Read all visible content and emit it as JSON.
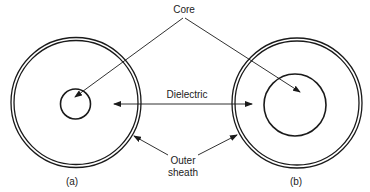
{
  "diagram": {
    "labels": {
      "core": "Core",
      "dielectric": "Dielectric",
      "outer_sheath_line1": "Outer",
      "outer_sheath_line2": "sheath",
      "caption_a": "(a)",
      "caption_b": "(b)"
    },
    "panels": [
      {
        "id": "a",
        "caption": "(a)",
        "outer_radius": 65,
        "core_radius": 15
      },
      {
        "id": "b",
        "caption": "(b)",
        "outer_radius": 65,
        "core_radius": 31
      }
    ],
    "colors": {
      "stroke": "#1a1a1a",
      "background": "#ffffff",
      "text": "#222222"
    }
  }
}
